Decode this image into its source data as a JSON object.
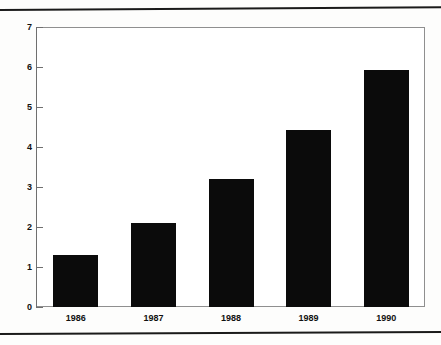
{
  "chart_data": {
    "type": "bar",
    "title": "",
    "xlabel": "",
    "ylabel": "",
    "categories": [
      "1986",
      "1987",
      "1988",
      "1989",
      "1990"
    ],
    "values": [
      1.3,
      2.1,
      3.2,
      4.43,
      5.93
    ],
    "ylim": [
      0,
      7
    ],
    "yticks": [
      "0",
      "1",
      "2",
      "3",
      "4",
      "5",
      "6",
      "7"
    ],
    "grid": false,
    "legend": null,
    "bar_color": "#0b0b0b",
    "axis_color": "#6f6f6f",
    "background": "#ffffff"
  },
  "page": {
    "background": "#fdfdfc",
    "rule_color": "#1a1a1a"
  }
}
